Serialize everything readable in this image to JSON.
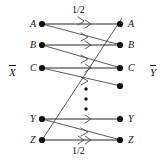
{
  "figure": {
    "type": "bipartite-transition-diagram",
    "width": 167,
    "height": 163,
    "background_color": "#ffffff",
    "line_color": "#6e6e6e",
    "diagonal_color": "#4a4a4a",
    "node_color": "#111111",
    "text_color": "#111111"
  },
  "side_labels": {
    "left": {
      "text": "X",
      "overline": true,
      "name": "input-alphabet-label"
    },
    "right": {
      "text": "Y",
      "overline": true,
      "name": "output-alphabet-label"
    }
  },
  "left_nodes": [
    {
      "label": "A",
      "x": 42,
      "y": 24
    },
    {
      "label": "B",
      "x": 42,
      "y": 45
    },
    {
      "label": "C",
      "x": 42,
      "y": 68
    },
    {
      "label": "Y",
      "x": 42,
      "y": 119
    },
    {
      "label": "Z",
      "x": 42,
      "y": 140
    }
  ],
  "right_nodes": [
    {
      "label": "A",
      "x": 120,
      "y": 24
    },
    {
      "label": "B",
      "x": 120,
      "y": 45
    },
    {
      "label": "C",
      "x": 120,
      "y": 68
    },
    {
      "label": "",
      "x": 120,
      "y": 86
    },
    {
      "label": "Y",
      "x": 120,
      "y": 119
    },
    {
      "label": "Z",
      "x": 120,
      "y": 140
    }
  ],
  "vertical_ellipsis": {
    "x": 86,
    "dots_y": [
      89,
      99,
      109
    ],
    "count": 3
  },
  "edges": [
    {
      "from": "A-left",
      "to": "A-right",
      "kind": "horizontal",
      "x1": 42,
      "y1": 24,
      "x2": 120,
      "y2": 24
    },
    {
      "from": "B-left",
      "to": "B-right",
      "kind": "horizontal",
      "x1": 42,
      "y1": 45,
      "x2": 120,
      "y2": 45
    },
    {
      "from": "C-left",
      "to": "C-right",
      "kind": "horizontal",
      "x1": 42,
      "y1": 68,
      "x2": 120,
      "y2": 68
    },
    {
      "from": "Y-left",
      "to": "Y-right",
      "kind": "horizontal",
      "x1": 42,
      "y1": 119,
      "x2": 120,
      "y2": 119
    },
    {
      "from": "Z-left",
      "to": "Z-right",
      "kind": "horizontal",
      "x1": 42,
      "y1": 140,
      "x2": 120,
      "y2": 140
    },
    {
      "from": "A-left",
      "to": "B-right",
      "kind": "diagonal",
      "x1": 42,
      "y1": 24,
      "x2": 120,
      "y2": 45
    },
    {
      "from": "B-left",
      "to": "C-right",
      "kind": "diagonal",
      "x1": 42,
      "y1": 45,
      "x2": 120,
      "y2": 68
    },
    {
      "from": "C-left",
      "to": "X-right",
      "kind": "diagonal",
      "x1": 42,
      "y1": 68,
      "x2": 120,
      "y2": 86
    },
    {
      "from": "Y-left",
      "to": "Z-right",
      "kind": "diagonal",
      "x1": 42,
      "y1": 119,
      "x2": 120,
      "y2": 140
    },
    {
      "from": "Z-left",
      "to": "A-right",
      "kind": "long-diagonal",
      "x1": 42,
      "y1": 140,
      "x2": 120,
      "y2": 20
    }
  ],
  "arrowheads": [
    {
      "on": "A-horizontal",
      "x": 90,
      "y": 24
    },
    {
      "on": "A-diagonal",
      "x": 90,
      "y": 37
    },
    {
      "on": "B-horizontal",
      "x": 90,
      "y": 45
    },
    {
      "on": "B-diagonal",
      "x": 90,
      "y": 59
    },
    {
      "on": "C-horizontal",
      "x": 90,
      "y": 68
    },
    {
      "on": "C-diagonal",
      "x": 90,
      "y": 81
    },
    {
      "on": "Y-horizontal",
      "x": 90,
      "y": 119
    },
    {
      "on": "Y-diagonal",
      "x": 90,
      "y": 132
    },
    {
      "on": "Z-horizontal",
      "x": 90,
      "y": 140
    }
  ],
  "edge_weights": [
    {
      "value": "1/2",
      "position": "top",
      "x": 72,
      "y": 8,
      "name": "transition-probability-top"
    },
    {
      "value": "1/2",
      "position": "bottom",
      "x": 72,
      "y": 146,
      "name": "transition-probability-bottom"
    }
  ]
}
